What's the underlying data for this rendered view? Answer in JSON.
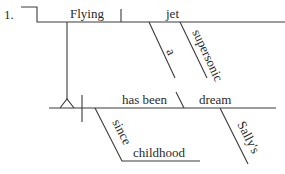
{
  "diagram": {
    "type": "sentence-diagram",
    "number": "1.",
    "words": {
      "subject": "Flying",
      "subject_object": "jet",
      "modifier_1": "a",
      "modifier_2": "supersonic",
      "verb": "has been",
      "predicate_noun": "dream",
      "preposition": "since",
      "prep_object": "childhood",
      "possessive": "Sally's"
    },
    "colors": {
      "line": "#3a3a3a",
      "text": "#2a2a2a",
      "background": "#ffffff"
    }
  }
}
